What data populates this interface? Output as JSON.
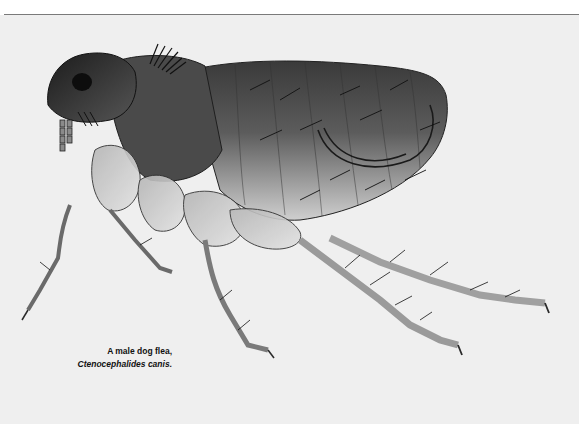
{
  "figure": {
    "caption": {
      "line1": "A male dog flea,",
      "line2": "Ctenocephalides canis."
    }
  },
  "colors": {
    "background": "#efefef",
    "rule": "#7a7a7a",
    "body_dark": "#2a2a2a",
    "body_mid": "#6e6e6e",
    "body_light": "#c8c8c8"
  }
}
